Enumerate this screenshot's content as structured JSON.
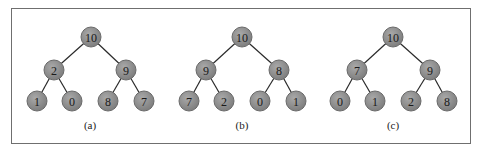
{
  "figure": {
    "colors": {
      "node_fill": "#8c8c8c",
      "node_fill_light": "#a8a8a8",
      "node_stroke": "#6a6a6a",
      "edge": "#2a2a2a",
      "frame": "#6f6f6f"
    },
    "trees": [
      {
        "caption": "(a)",
        "nodes": [
          {
            "value": "10",
            "x": 91,
            "y": 37
          },
          {
            "value": "2",
            "x": 54,
            "y": 70
          },
          {
            "value": "9",
            "x": 126,
            "y": 70
          },
          {
            "value": "1",
            "x": 37,
            "y": 101
          },
          {
            "value": "0",
            "x": 72,
            "y": 101
          },
          {
            "value": "8",
            "x": 108,
            "y": 101
          },
          {
            "value": "7",
            "x": 144,
            "y": 101
          }
        ],
        "caption_pos": {
          "x": 90,
          "y": 129
        }
      },
      {
        "caption": "(b)",
        "nodes": [
          {
            "value": "10",
            "x": 242,
            "y": 37
          },
          {
            "value": "9",
            "x": 206,
            "y": 70
          },
          {
            "value": "8",
            "x": 279,
            "y": 70
          },
          {
            "value": "7",
            "x": 189,
            "y": 101
          },
          {
            "value": "2",
            "x": 224,
            "y": 101
          },
          {
            "value": "0",
            "x": 260,
            "y": 101
          },
          {
            "value": "1",
            "x": 296,
            "y": 101
          }
        ],
        "caption_pos": {
          "x": 242,
          "y": 129
        }
      },
      {
        "caption": "(c)",
        "nodes": [
          {
            "value": "10",
            "x": 393,
            "y": 37
          },
          {
            "value": "7",
            "x": 357,
            "y": 70
          },
          {
            "value": "9",
            "x": 430,
            "y": 70
          },
          {
            "value": "0",
            "x": 340,
            "y": 101
          },
          {
            "value": "1",
            "x": 375,
            "y": 101
          },
          {
            "value": "2",
            "x": 411,
            "y": 101
          },
          {
            "value": "8",
            "x": 447,
            "y": 101
          }
        ],
        "caption_pos": {
          "x": 393,
          "y": 129
        }
      }
    ],
    "edges": [
      [
        0,
        1
      ],
      [
        0,
        2
      ],
      [
        1,
        3
      ],
      [
        1,
        4
      ],
      [
        2,
        5
      ],
      [
        2,
        6
      ]
    ],
    "node_radius": 10
  }
}
